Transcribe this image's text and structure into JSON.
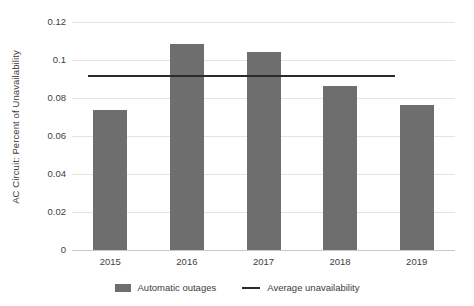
{
  "chart_data": {
    "type": "bar",
    "title": "",
    "xlabel": "",
    "ylabel": "AC Circuit: Percent of Unavailability",
    "categories": [
      "2015",
      "2016",
      "2017",
      "2018",
      "2019"
    ],
    "series": [
      {
        "name": "Automatic outages",
        "type": "bar",
        "color": "#6e6e6e",
        "values": [
          0.0735,
          0.1085,
          0.104,
          0.0865,
          0.0765
        ]
      },
      {
        "name": "Average unavailability",
        "type": "line",
        "color": "#2b2b2b",
        "value": 0.0915
      }
    ],
    "ylim": [
      0,
      0.12
    ],
    "ytick_values": [
      0,
      0.02,
      0.04,
      0.06,
      0.08,
      0.1,
      0.12
    ],
    "ytick_labels": [
      "0",
      "0.02",
      "0.04",
      "0.06",
      "0.08",
      "0.1",
      "0.12"
    ],
    "grid": true,
    "grid_axis": "y",
    "legend_position": "bottom"
  },
  "legend": {
    "entries": [
      {
        "label": "Automatic outages",
        "marker": "bar-swatch"
      },
      {
        "label": "Average unavailability",
        "marker": "line-swatch"
      }
    ]
  },
  "colors": {
    "bar": "#6e6e6e",
    "line": "#2b2b2b",
    "grid": "#e4e4e4",
    "axis": "#c9c9c9",
    "text": "#3d3d3d",
    "background": "#ffffff"
  }
}
